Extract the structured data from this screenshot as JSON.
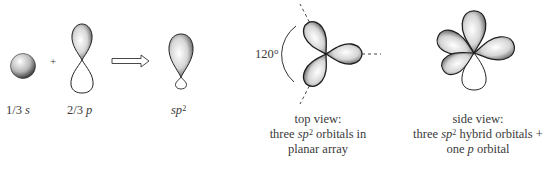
{
  "figure": {
    "colors": {
      "lobe_dark": "#2a2a2a",
      "lobe_light": "#f4f4f4",
      "line": "#222222",
      "text": "#3a3a3a"
    }
  },
  "equation": {
    "s_label": {
      "frac": "1/3",
      "orb": "s"
    },
    "plus": "+",
    "p_label": {
      "frac": "2/3",
      "orb": "p"
    },
    "arrow": "⇒",
    "result_label": {
      "base": "sp",
      "sup": "2"
    }
  },
  "top_view": {
    "angle_label": "120°",
    "caption_line1": "top view:",
    "caption_line2_pre": "three ",
    "caption_line2_base": "sp",
    "caption_line2_sup": "2",
    "caption_line2_post": " orbitals in",
    "caption_line3": "planar array"
  },
  "side_view": {
    "caption_line1": "side view:",
    "caption_line2_pre": "three ",
    "caption_line2_base": "sp",
    "caption_line2_sup": "2",
    "caption_line2_post": " hybrid orbitals +",
    "caption_line3_pre": "one ",
    "caption_line3_it": "p",
    "caption_line3_post": " orbital"
  }
}
